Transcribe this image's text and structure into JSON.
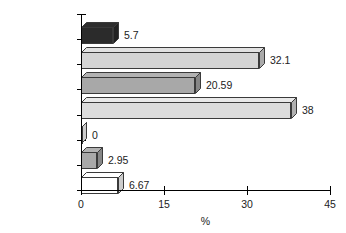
{
  "chart_data": {
    "type": "bar",
    "orientation": "horizontal",
    "title": "",
    "subtitle": "",
    "xlabel": "%",
    "ylabel": "",
    "categories": [
      "Carnevale",
      "Buhler",
      "Erpenstein",
      "Langer",
      "Hamp",
      "Klavan",
      "Bergenholtz"
    ],
    "values": [
      5.7,
      32.1,
      20.59,
      38,
      0,
      2.95,
      6.67
    ],
    "value_labels": [
      "5.7",
      "32.1",
      "20.59",
      "38",
      "0",
      "2.95",
      "6.67"
    ],
    "series": [
      {
        "name": "%",
        "values": [
          5.7,
          32.1,
          20.59,
          38,
          0,
          2.95,
          6.67
        ]
      }
    ],
    "bar_colors": [
      "#2b2b2b",
      "#d4d4d4",
      "#a8a8a8",
      "#dcdcdc",
      "#ffffff",
      "#a8a8a8",
      "#ffffff"
    ],
    "xlim": [
      0,
      45
    ],
    "xticks": [
      0,
      15,
      30,
      45
    ],
    "xtick_labels": [
      "0",
      "15",
      "30",
      "45"
    ],
    "grid": false,
    "legend": "none",
    "style_3d": true
  },
  "axis": {
    "x_title": "%",
    "tick_labels": [
      "0",
      "15",
      "30",
      "45"
    ]
  },
  "rows": [
    {
      "label": "Carnevale",
      "value_label": "5.7"
    },
    {
      "label": "Buhler",
      "value_label": "32.1"
    },
    {
      "label": "Erpenstein",
      "value_label": "20.59"
    },
    {
      "label": "Langer",
      "value_label": "38"
    },
    {
      "label": "Hamp",
      "value_label": "0"
    },
    {
      "label": "Klavan",
      "value_label": "2.95"
    },
    {
      "label": "Bergenholtz",
      "value_label": "6.67"
    }
  ],
  "colors": {
    "axis": "#000000",
    "text": "#222222",
    "background": "#ffffff",
    "bar_outline": "#3a3a3a"
  }
}
